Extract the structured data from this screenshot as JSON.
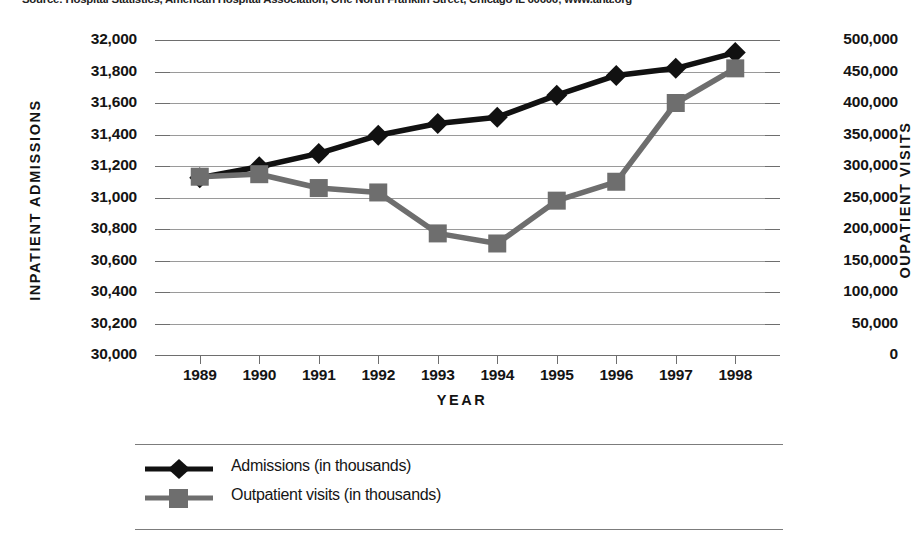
{
  "source_note": "Source: Hospital Statistics, American Hospital Association, One North Franklin Street, Chicago IL 60606; www.aha.org",
  "axes": {
    "left_title": "INPATIENT ADMISSIONS",
    "right_title": "OUPATIENT VISITS",
    "x_title": "YEAR",
    "left_ticks": [
      "32,000",
      "31,800",
      "31,600",
      "31,400",
      "31,200",
      "31,000",
      "30,800",
      "30,600",
      "30,400",
      "30,200",
      "30,000"
    ],
    "right_ticks": [
      "500,000",
      "450,000",
      "400,000",
      "350,000",
      "300,000",
      "250,000",
      "200,000",
      "150,000",
      "100,000",
      "50,000",
      "0"
    ]
  },
  "legend": {
    "admissions_label": "Admissions (in thousands)",
    "outpatient_label": "Outpatient visits (in thousands)",
    "admissions_marker": "black-diamond-marker",
    "outpatient_marker": "gray-square-marker"
  },
  "colors": {
    "admissions": "#111111",
    "outpatient": "#6e6e6e",
    "gridline": "#9a9a9a",
    "axis": "#6e6e6e",
    "text": "#141414"
  },
  "chart_data": {
    "type": "line",
    "title": "",
    "xlabel": "YEAR",
    "grid": true,
    "legend_position": "bottom-left",
    "categories": [
      "1989",
      "1990",
      "1991",
      "1992",
      "1993",
      "1994",
      "1995",
      "1996",
      "1997",
      "1998"
    ],
    "axes": {
      "y_left": {
        "label": "INPATIENT ADMISSIONS",
        "ylim": [
          30000,
          32000
        ],
        "tick_step": 200,
        "ticks": [
          30000,
          30200,
          30400,
          30600,
          30800,
          31000,
          31200,
          31400,
          31600,
          31800,
          32000
        ]
      },
      "y_right": {
        "label": "OUPATIENT VISITS",
        "ylim": [
          0,
          500000
        ],
        "tick_step": 50000,
        "ticks": [
          0,
          50000,
          100000,
          150000,
          200000,
          250000,
          300000,
          350000,
          400000,
          450000,
          500000
        ]
      }
    },
    "series": [
      {
        "name": "Admissions (in thousands)",
        "axis": "left",
        "marker": "diamond",
        "color": "#111111",
        "values": [
          31125,
          31195,
          31280,
          31395,
          31470,
          31510,
          31650,
          31775,
          31820,
          31920
        ]
      },
      {
        "name": "Outpatient visits (in thousands)",
        "axis": "right",
        "marker": "square",
        "color": "#6e6e6e",
        "values": [
          283000,
          287000,
          265000,
          258000,
          193000,
          177000,
          245000,
          275000,
          400000,
          455000
        ]
      }
    ]
  }
}
